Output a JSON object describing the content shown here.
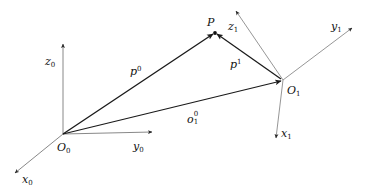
{
  "figure": {
    "type": "vector-diagram",
    "background_color": "#ffffff",
    "width": 370,
    "height": 191,
    "colors": {
      "vector_stroke": "#1a1a1a",
      "axis_stroke_frame0": "#7a7a7a",
      "axis_stroke_frame1": "#8a8a8a",
      "label_color": "#111111"
    }
  },
  "points": {
    "origin_0": {
      "name": "O",
      "sub": "0",
      "x": 63,
      "y": 134,
      "label_x": 57,
      "label_y": 138
    },
    "origin_1": {
      "name": "O",
      "sub": "1",
      "x": 283,
      "y": 80,
      "label_x": 287,
      "label_y": 81
    },
    "point_p": {
      "name": "P",
      "sub": "",
      "x": 215,
      "y": 33,
      "label_x": 207,
      "label_y": 13
    }
  },
  "axes": [
    {
      "id": "x0",
      "base": "x",
      "sub": "0",
      "frame": "0",
      "from": {
        "x": 63,
        "y": 134
      },
      "to": {
        "x": 15,
        "y": 173
      },
      "label_x": 22,
      "label_y": 170,
      "color": "#7a7a7a"
    },
    {
      "id": "y0",
      "base": "y",
      "sub": "0",
      "frame": "0",
      "from": {
        "x": 63,
        "y": 134
      },
      "to": {
        "x": 152,
        "y": 132
      },
      "label_x": 133,
      "label_y": 137,
      "color": "#7a7a7a"
    },
    {
      "id": "z0",
      "base": "z",
      "sub": "0",
      "frame": "0",
      "from": {
        "x": 63,
        "y": 134
      },
      "to": {
        "x": 63,
        "y": 44
      },
      "label_x": 45,
      "label_y": 52,
      "color": "#7a7a7a"
    },
    {
      "id": "x1",
      "base": "x",
      "sub": "1",
      "frame": "1",
      "from": {
        "x": 283,
        "y": 80
      },
      "to": {
        "x": 276,
        "y": 138
      },
      "label_x": 281,
      "label_y": 124,
      "color": "#8a8a8a"
    },
    {
      "id": "y1",
      "base": "y",
      "sub": "1",
      "frame": "1",
      "from": {
        "x": 283,
        "y": 80
      },
      "to": {
        "x": 352,
        "y": 28
      },
      "label_x": 331,
      "label_y": 17,
      "color": "#8a8a8a"
    },
    {
      "id": "z1",
      "base": "z",
      "sub": "1",
      "frame": "1",
      "from": {
        "x": 283,
        "y": 80
      },
      "to": {
        "x": 236,
        "y": 11
      },
      "label_x": 228,
      "label_y": 17,
      "color": "#8a8a8a"
    }
  ],
  "vectors": [
    {
      "id": "p0",
      "base": "p",
      "sup": "0",
      "sub": "",
      "description": "position of P in frame 0",
      "from": {
        "x": 63,
        "y": 134
      },
      "to": {
        "x": 213,
        "y": 34
      },
      "label_x": 130,
      "label_y": 62,
      "color": "#1a1a1a"
    },
    {
      "id": "p1",
      "base": "p",
      "sup": "1",
      "sub": "",
      "description": "position of P in frame 1",
      "from": {
        "x": 281,
        "y": 79
      },
      "to": {
        "x": 217,
        "y": 34
      },
      "label_x": 230,
      "label_y": 55,
      "color": "#1a1a1a"
    },
    {
      "id": "o1_0",
      "base": "o",
      "sup": "0",
      "sub": "1",
      "description": "origin of frame 1 expressed in frame 0",
      "from": {
        "x": 63,
        "y": 134
      },
      "to": {
        "x": 281,
        "y": 81
      },
      "label_x": 187,
      "label_y": 110,
      "color": "#1a1a1a"
    }
  ]
}
